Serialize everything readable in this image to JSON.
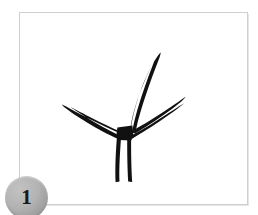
{
  "figure": {
    "badge_number": "1",
    "caption": "",
    "frame": {
      "border_color": "#cfcfcf",
      "background_color": "#ffffff",
      "x": 19,
      "y": 12,
      "width": 229,
      "height": 193
    },
    "badge": {
      "fill_color": "#b3b3b3",
      "text_color": "#1a1a1a",
      "shape": "circle",
      "diameter": 43
    },
    "artwork": {
      "name": "sprout-sketch",
      "description": "hand-drawn ink sketch of a sprout: a vertical stem with a tall curved shoot rising to the upper right and two thin tapering side branches angling down-left and down-right from a central junction",
      "ink_color": "#111111",
      "style": "hand-drawn-ink",
      "strokes": [
        {
          "name": "main-stem",
          "d": "M 104 167 L 104 121 L 112 119 L 112 167 Z"
        },
        {
          "name": "upper-shoot",
          "d": "M 114 121 C 116 104 122 84 133 62 C 136 56 138 52 140 50 C 139 55 137 61 135 68 C 128 90 123 107 121 123 Z"
        },
        {
          "name": "upper-shoot-inner",
          "d": "M 116 121 C 118 106 124 87 134 66 C 133 72 130 80 127 90 C 123 103 120 113 118 123 Z"
        },
        {
          "name": "left-branch",
          "d": "M 103 122 C 90 117 74 110 58 101 C 54 99 51 97 49 96 C 52 96 57 98 63 100 C 79 107 94 114 105 119 Z"
        },
        {
          "name": "right-branch",
          "d": "M 113 121 C 125 114 140 105 155 95 C 159 92 163 90 165 89 C 163 91 159 94 154 98 C 139 108 124 117 114 124 Z"
        },
        {
          "name": "junction-node",
          "d": "M 102 116 L 114 114 L 116 126 L 102 128 Z"
        }
      ],
      "viewbox": "0 0 229 193"
    }
  }
}
